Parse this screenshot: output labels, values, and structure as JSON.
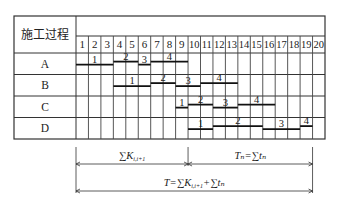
{
  "header": {
    "process_label": "施工过程",
    "days": [
      "1",
      "2",
      "3",
      "4",
      "5",
      "6",
      "7",
      "8",
      "9",
      "10",
      "11",
      "12",
      "13",
      "14",
      "15",
      "16",
      "17",
      "18",
      "19",
      "20"
    ]
  },
  "processes": [
    {
      "name": "A",
      "segments": [
        {
          "label": "1",
          "start": 1,
          "end": 3
        },
        {
          "label": "2",
          "start": 4,
          "end": 5
        },
        {
          "label": "3",
          "start": 6,
          "end": 6
        },
        {
          "label": "4",
          "start": 7,
          "end": 9
        }
      ]
    },
    {
      "name": "B",
      "segments": [
        {
          "label": "1",
          "start": 4,
          "end": 6
        },
        {
          "label": "2",
          "start": 7,
          "end": 8
        },
        {
          "label": "3",
          "start": 9,
          "end": 10
        },
        {
          "label": "4",
          "start": 11,
          "end": 13
        }
      ]
    },
    {
      "name": "C",
      "segments": [
        {
          "label": "1",
          "start": 9,
          "end": 9
        },
        {
          "label": "2",
          "start": 10,
          "end": 11
        },
        {
          "label": "3",
          "start": 12,
          "end": 13
        },
        {
          "label": "4",
          "start": 14,
          "end": 16
        }
      ]
    },
    {
      "name": "D",
      "segments": [
        {
          "label": "1",
          "start": 10,
          "end": 11
        },
        {
          "label": "2",
          "start": 12,
          "end": 15
        },
        {
          "label": "3",
          "start": 16,
          "end": 18
        },
        {
          "label": "4",
          "start": 19,
          "end": 19
        }
      ]
    }
  ],
  "annotations": {
    "sum_k": "∑K",
    "sum_k_sub": "i,i+1",
    "tn_label": "Tₙ=∑tₙ",
    "total_label": "T=∑K",
    "total_suffix": "+∑tₙ",
    "split_day": 9,
    "end_day": 19
  }
}
